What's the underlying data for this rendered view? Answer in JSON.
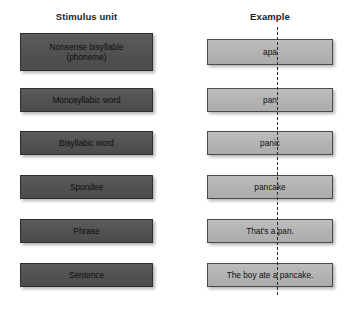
{
  "figure": {
    "columns": {
      "stimulus_header": "Stimulus unit",
      "example_header": "Example"
    },
    "rows": [
      {
        "stimulus_line1": "Nonsense bisyllable",
        "stimulus_line2": "(phoneme)",
        "example": "apa"
      },
      {
        "stimulus_line1": "Monosyllabic word",
        "stimulus_line2": "",
        "example": "pan"
      },
      {
        "stimulus_line1": "Bisyllabic word",
        "stimulus_line2": "",
        "example": "panic"
      },
      {
        "stimulus_line1": "Spondee",
        "stimulus_line2": "",
        "example": "pancake"
      },
      {
        "stimulus_line1": "Phrase",
        "stimulus_line2": "",
        "example": "That's a pan."
      },
      {
        "stimulus_line1": "Sentence",
        "stimulus_line2": "",
        "example": "The boy ate a pancake."
      }
    ],
    "caption": {
      "label": "",
      "text": ""
    },
    "colors": {
      "stimulus_box": "#545454",
      "example_box": "#b4b4b4",
      "box_border": "#3c3c3c",
      "divider_line": "#2b2b2b",
      "page_background": "#ffffff",
      "text": "#101010"
    }
  }
}
